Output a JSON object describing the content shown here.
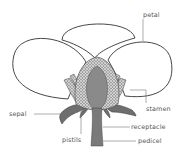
{
  "diagram": {
    "labels": {
      "petal": "petal",
      "stamen": "stamen",
      "sepal": "sepal",
      "receptacle": "receptacle",
      "pistils": "pistils",
      "pedicel": "pedicel"
    },
    "colors": {
      "outline": "#333333",
      "receptacle_fill": "#8a8a8a",
      "sepal_fill": "#6e6e6e",
      "pistil_texture": "#5a5a5a",
      "label_text": "#555555",
      "leader_line": "#777777",
      "background": "#ffffff"
    }
  }
}
